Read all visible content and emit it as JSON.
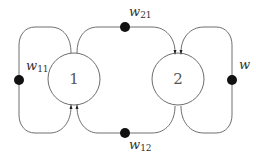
{
  "diagram": {
    "type": "weighted-graph",
    "nodes": [
      {
        "id": "1",
        "label": "1"
      },
      {
        "id": "2",
        "label": "2"
      }
    ],
    "edges": [
      {
        "from": "1",
        "to": "1",
        "weight": {
          "base": "w",
          "sub": "11"
        }
      },
      {
        "from": "1",
        "to": "2",
        "weight": {
          "base": "w",
          "sub": "21"
        }
      },
      {
        "from": "2",
        "to": "1",
        "weight": {
          "base": "w",
          "sub": "12"
        }
      },
      {
        "from": "2",
        "to": "2",
        "weight": {
          "base": "w",
          "sub": ""
        }
      }
    ],
    "colors": {
      "line": "#6e6e6e",
      "dot": "#111111",
      "background": "#ffffff"
    }
  }
}
